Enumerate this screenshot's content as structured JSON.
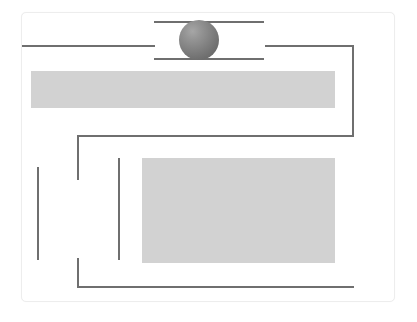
{
  "canvas": {
    "width": 417,
    "height": 322,
    "background": "#ffffff"
  },
  "panel": {
    "name": "diagram-panel",
    "x": 21,
    "y": 12,
    "width": 374,
    "height": 290,
    "fill": "#ffffff",
    "border_color": "#ededed",
    "corner_radius": 5
  },
  "palette": {
    "line": "#6f6f6f",
    "band": "#d2d2d2",
    "sphere_light": "#a6a6a6",
    "sphere_dark": "#5f5f5f",
    "panel_border": "#ededed",
    "background": "#ffffff"
  },
  "sphere": {
    "name": "shaded-sphere",
    "cx": 199,
    "cy": 40,
    "r": 20,
    "highlight_x_pct": 34,
    "highlight_y_pct": 28
  },
  "bands": [
    {
      "name": "upper-gray-band",
      "x": 31,
      "y": 71,
      "width": 304,
      "height": 37,
      "fill": "#d2d2d2"
    },
    {
      "name": "lower-gray-block",
      "x": 142,
      "y": 158,
      "width": 193,
      "height": 105,
      "fill": "#d2d2d2"
    }
  ],
  "segments": [
    {
      "name": "sphere-top-rail",
      "orientation": "horizontal",
      "x": 154,
      "y": 21,
      "length": 110,
      "thickness": 2
    },
    {
      "name": "sphere-bottom-rail",
      "orientation": "horizontal",
      "x": 154,
      "y": 58,
      "length": 110,
      "thickness": 2
    },
    {
      "name": "left-feed-line",
      "orientation": "horizontal",
      "x": 22,
      "y": 45,
      "length": 133,
      "thickness": 2
    },
    {
      "name": "right-feed-line",
      "orientation": "horizontal",
      "x": 265,
      "y": 45,
      "length": 89,
      "thickness": 2
    },
    {
      "name": "right-return-drop",
      "orientation": "vertical",
      "x": 352,
      "y": 45,
      "length": 92,
      "thickness": 2
    },
    {
      "name": "mid-bracket-top-arm",
      "orientation": "horizontal",
      "x": 77,
      "y": 135,
      "length": 277,
      "thickness": 2
    },
    {
      "name": "mid-bracket-left-drop",
      "orientation": "vertical",
      "x": 77,
      "y": 135,
      "length": 45,
      "thickness": 2
    },
    {
      "name": "lower-bracket-left-rise",
      "orientation": "vertical",
      "x": 77,
      "y": 258,
      "length": 30,
      "thickness": 2
    },
    {
      "name": "lower-bracket-bottom-arm",
      "orientation": "horizontal",
      "x": 77,
      "y": 286,
      "length": 277,
      "thickness": 2
    },
    {
      "name": "outer-left-tick",
      "orientation": "vertical",
      "x": 37,
      "y": 167,
      "length": 93,
      "thickness": 2
    },
    {
      "name": "inner-left-tick",
      "orientation": "vertical",
      "x": 118,
      "y": 158,
      "length": 102,
      "thickness": 2
    }
  ]
}
